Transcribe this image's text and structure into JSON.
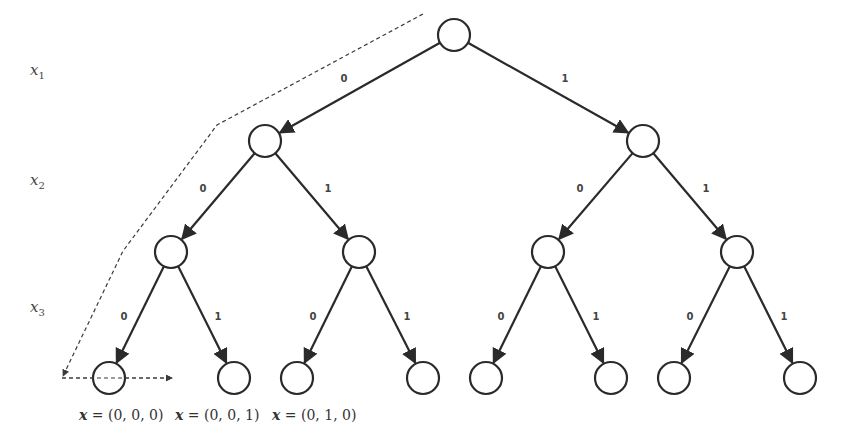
{
  "diagram": {
    "variable_labels": [
      {
        "name": "x",
        "sub": "1",
        "x": 30,
        "y": 75
      },
      {
        "name": "x",
        "sub": "2",
        "x": 30,
        "y": 185
      },
      {
        "name": "x",
        "sub": "3",
        "x": 30,
        "y": 312
      }
    ],
    "node_radius": 16,
    "nodes": [
      {
        "id": "root",
        "x": 454,
        "y": 35
      },
      {
        "id": "n0",
        "x": 265,
        "y": 141
      },
      {
        "id": "n1",
        "x": 643,
        "y": 141
      },
      {
        "id": "n00",
        "x": 171,
        "y": 252
      },
      {
        "id": "n01",
        "x": 359,
        "y": 252
      },
      {
        "id": "n10",
        "x": 548,
        "y": 252
      },
      {
        "id": "n11",
        "x": 737,
        "y": 252
      },
      {
        "id": "l000",
        "x": 109,
        "y": 378
      },
      {
        "id": "l001",
        "x": 234,
        "y": 378
      },
      {
        "id": "l010",
        "x": 297,
        "y": 378
      },
      {
        "id": "l011",
        "x": 423,
        "y": 378
      },
      {
        "id": "l100",
        "x": 486,
        "y": 378
      },
      {
        "id": "l101",
        "x": 611,
        "y": 378
      },
      {
        "id": "l110",
        "x": 674,
        "y": 378
      },
      {
        "id": "l111",
        "x": 800,
        "y": 378
      }
    ],
    "edges": [
      {
        "from": "root",
        "to": "n0",
        "label": "0",
        "lx": 344,
        "ly": 82
      },
      {
        "from": "root",
        "to": "n1",
        "label": "1",
        "lx": 565,
        "ly": 82
      },
      {
        "from": "n0",
        "to": "n00",
        "label": "0",
        "lx": 203,
        "ly": 192
      },
      {
        "from": "n0",
        "to": "n01",
        "label": "1",
        "lx": 328,
        "ly": 192
      },
      {
        "from": "n1",
        "to": "n10",
        "label": "0",
        "lx": 580,
        "ly": 192
      },
      {
        "from": "n1",
        "to": "n11",
        "label": "1",
        "lx": 706,
        "ly": 192
      },
      {
        "from": "n00",
        "to": "l000",
        "label": "0",
        "lx": 124,
        "ly": 320
      },
      {
        "from": "n00",
        "to": "l001",
        "label": "1",
        "lx": 218,
        "ly": 320
      },
      {
        "from": "n01",
        "to": "l010",
        "label": "0",
        "lx": 313,
        "ly": 320
      },
      {
        "from": "n01",
        "to": "l011",
        "label": "1",
        "lx": 407,
        "ly": 320
      },
      {
        "from": "n10",
        "to": "l100",
        "label": "0",
        "lx": 501,
        "ly": 320
      },
      {
        "from": "n10",
        "to": "l101",
        "label": "1",
        "lx": 596,
        "ly": 320
      },
      {
        "from": "n11",
        "to": "l110",
        "label": "0",
        "lx": 690,
        "ly": 320
      },
      {
        "from": "n11",
        "to": "l111",
        "label": "1",
        "lx": 784,
        "ly": 320
      }
    ],
    "traversal_path": {
      "points": [
        [
          423,
          14
        ],
        [
          217,
          125
        ],
        [
          123,
          251
        ],
        [
          63,
          376
        ]
      ],
      "style": "dashed"
    },
    "leaf_scan_arrow": {
      "from": [
        62,
        378
      ],
      "to": [
        172,
        378
      ],
      "style": "dashed"
    },
    "leaf_labels": [
      {
        "var": "x",
        "eq": " = ",
        "value": "(0, 0, 0)",
        "x": 79,
        "y": 420
      },
      {
        "var": "x",
        "eq": " = ",
        "value": "(0, 0, 1)",
        "x": 175,
        "y": 420
      },
      {
        "var": "x",
        "eq": " = ",
        "value": "(0, 1, 0)",
        "x": 272,
        "y": 420
      }
    ]
  }
}
